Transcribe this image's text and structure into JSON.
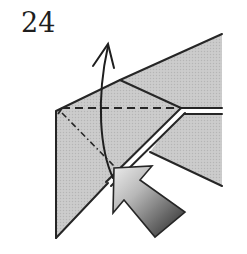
{
  "step": {
    "number": "24"
  },
  "diagram": {
    "symbols": [
      "valley-fold-line",
      "mountain-fold-line",
      "curved-fold-arrow",
      "push-arrow"
    ],
    "colors": {
      "paper": "#c8c8c8",
      "line": "#262626",
      "background": "#ffffff",
      "push_arrow_light": "#e6e6e6",
      "push_arrow_dark": "#2a2a2a"
    }
  }
}
